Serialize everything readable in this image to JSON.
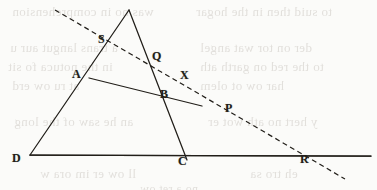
{
  "figure": {
    "canvas": {
      "width": 377,
      "height": 190
    },
    "ink_color": "#211e19",
    "page_color": "#fbfbf9",
    "ghost_text_color": "#b9b3ac",
    "points": [
      {
        "id": "apex",
        "label": "",
        "x": 129,
        "y": 10,
        "label_x": 0,
        "label_y": 0,
        "labeled": false
      },
      {
        "id": "S",
        "label": "S",
        "x": 105,
        "y": 43,
        "label_x": 98,
        "label_y": 33
      },
      {
        "id": "Q",
        "label": "Q",
        "x": 150,
        "y": 64,
        "label_x": 152,
        "label_y": 50
      },
      {
        "id": "A",
        "label": "A",
        "x": 89,
        "y": 78,
        "label_x": 72,
        "label_y": 68
      },
      {
        "id": "X",
        "label": "X",
        "x": 186,
        "y": 79,
        "label_x": 180,
        "label_y": 69
      },
      {
        "id": "B",
        "label": "B",
        "x": 163,
        "y": 97,
        "label_x": 160,
        "label_y": 88
      },
      {
        "id": "P",
        "label": "P",
        "x": 228,
        "y": 114,
        "label_x": 225,
        "label_y": 102
      },
      {
        "id": "D",
        "label": "D",
        "x": 30,
        "y": 155,
        "label_x": 12,
        "label_y": 152
      },
      {
        "id": "C",
        "label": "C",
        "x": 185,
        "y": 155,
        "label_x": 178,
        "label_y": 155
      },
      {
        "id": "R",
        "label": "R",
        "x": 305,
        "y": 156,
        "label_x": 300,
        "label_y": 153
      }
    ],
    "solid_segments": [
      {
        "name": "base-line-D-to-right-end",
        "x1": 30,
        "y1": 155,
        "x2": 371,
        "y2": 156
      },
      {
        "name": "side-D-to-apex-through-A-and-S",
        "x1": 30,
        "y1": 155,
        "x2": 129,
        "y2": 10
      },
      {
        "name": "side-apex-to-C-through-Q-and-B",
        "x1": 129,
        "y1": 10,
        "x2": 187,
        "y2": 160
      },
      {
        "name": "ray-D-through-B-and-P-to-base-right",
        "x1": 30,
        "y1": 155,
        "x2": 371,
        "y2": 156
      },
      {
        "name": "segment-A-through-B-to-X-side",
        "x1": 89,
        "y1": 78,
        "x2": 202,
        "y2": 106
      }
    ],
    "dashed_segments": [
      {
        "name": "transversal-through-S-Q-X-P-R",
        "x1": 55,
        "y1": 10,
        "x2": 345,
        "y2": 179
      }
    ],
    "ghost_text_lines": [
      {
        "text": "was no in comprehension",
        "x": 12,
        "y": 4,
        "size": 13
      },
      {
        "text": "to suid then in the hogar",
        "x": 196,
        "y": 4,
        "size": 13
      },
      {
        "text": "a trans langut aur u",
        "x": 10,
        "y": 40,
        "size": 13
      },
      {
        "text": "der on tor wat angel",
        "x": 200,
        "y": 40,
        "size": 13
      },
      {
        "text": "to the red on garth ath",
        "x": 200,
        "y": 59,
        "size": 13
      },
      {
        "text": "in the notuca fo sit",
        "x": 8,
        "y": 59,
        "size": 13
      },
      {
        "text": "har ow ot olem",
        "x": 200,
        "y": 78,
        "size": 13
      },
      {
        "text": "at ru ow erd",
        "x": 12,
        "y": 78,
        "size": 13
      },
      {
        "text": "an he saw of the long",
        "x": 14,
        "y": 114,
        "size": 13
      },
      {
        "text": "y hert no ath wot er",
        "x": 208,
        "y": 114,
        "size": 13
      },
      {
        "text": "ll ow er im ora w",
        "x": 40,
        "y": 166,
        "size": 13
      },
      {
        "text": "eh tro sa",
        "x": 250,
        "y": 166,
        "size": 13
      },
      {
        "text": "no a ret ow",
        "x": 140,
        "y": 182,
        "size": 12
      }
    ]
  }
}
